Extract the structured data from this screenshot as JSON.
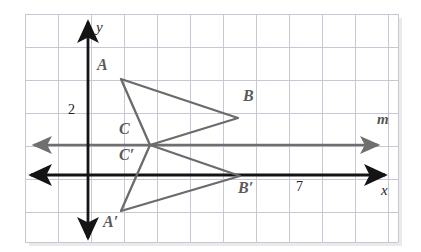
{
  "figure": {
    "type": "coordinate-grid-reflection-diagram",
    "canvas": {
      "width": 421,
      "height": 252,
      "background": "#ffffff"
    },
    "grid": {
      "left": 25,
      "top": 14,
      "right": 398,
      "bottom": 242,
      "spacing": 33,
      "line_color": "#c9c6d6",
      "border_color": "#bdbac9"
    },
    "axes": {
      "x_axis": {
        "label": "x",
        "y_px": 175,
        "color": "#1a1a1a",
        "label_x": 381,
        "label_y": 183
      },
      "y_axis": {
        "label": "y",
        "x_px": 88,
        "color": "#1a1a1a",
        "label_x": 96,
        "label_y": 20
      },
      "line_m": {
        "label": "m",
        "y_px": 145,
        "color": "#6f6f6f",
        "label_x": 377,
        "label_y": 112
      },
      "scale_label_y": {
        "text": "2",
        "x": 68,
        "y": 103
      },
      "scale_label_x": {
        "text": "7",
        "x": 296,
        "y": 180
      }
    },
    "shapes": [
      {
        "name": "triangle-ABC",
        "color": "#6b6b6b",
        "stroke_width": 2.2,
        "vertices": [
          {
            "id": "A",
            "x": 121,
            "y": 79
          },
          {
            "id": "B",
            "x": 238,
            "y": 118
          },
          {
            "id": "C",
            "x": 150,
            "y": 145
          }
        ]
      },
      {
        "name": "triangle-A-prime-B-prime-C-prime",
        "color": "#6b6b6b",
        "stroke_width": 2.2,
        "vertices": [
          {
            "id": "A'",
            "x": 121,
            "y": 211
          },
          {
            "id": "B'",
            "x": 240,
            "y": 176
          },
          {
            "id": "C'",
            "x": 150,
            "y": 145
          }
        ]
      }
    ],
    "point_labels": [
      {
        "text": "A",
        "x": 97,
        "y": 57
      },
      {
        "text": "B",
        "x": 243,
        "y": 88
      },
      {
        "text": "C",
        "x": 119,
        "y": 121
      },
      {
        "text": "C′",
        "x": 119,
        "y": 147
      },
      {
        "text": "B′",
        "x": 238,
        "y": 180
      },
      {
        "text": "A′",
        "x": 103,
        "y": 214
      }
    ]
  }
}
